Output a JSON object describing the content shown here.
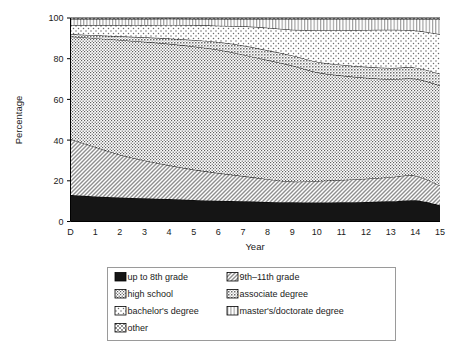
{
  "chart_data": {
    "type": "area",
    "title": "",
    "xlabel": "Year",
    "ylabel": "Percentage",
    "xlim": [
      0,
      16
    ],
    "ylim": [
      0,
      100
    ],
    "grid": false,
    "legend_position": "bottom",
    "categories": [
      "D",
      "1",
      "2",
      "3",
      "4",
      "5",
      "6",
      "7",
      "8",
      "9",
      "10",
      "11",
      "12",
      "13",
      "14",
      "15"
    ],
    "x_tick_labels": [
      "D",
      "1",
      "2",
      "3",
      "4",
      "5",
      "6",
      "7",
      "8",
      "9",
      "10",
      "11",
      "12",
      "13",
      "14",
      "15"
    ],
    "y_tick_labels": [
      "0",
      "20",
      "40",
      "60",
      "80",
      "100"
    ],
    "y_ticks": [
      0,
      20,
      40,
      60,
      80,
      100
    ],
    "stacked": true,
    "series": [
      {
        "name": "up to 8th grade",
        "pattern": "solid-black",
        "values": [
          13.0,
          12.3,
          11.8,
          11.4,
          11.0,
          10.6,
          10.2,
          9.9,
          9.6,
          9.4,
          9.3,
          9.4,
          9.6,
          9.9,
          10.4,
          8.0
        ]
      },
      {
        "name": "9th-11th grade",
        "pattern": "diagonal-hatch-light",
        "values": [
          27.5,
          24.3,
          21.0,
          18.6,
          16.6,
          14.9,
          13.6,
          12.4,
          11.2,
          10.2,
          10.6,
          11.0,
          11.4,
          11.9,
          12.1,
          9.6
        ]
      },
      {
        "name": "high school",
        "pattern": "fine-dots",
        "values": [
          50.4,
          53.5,
          56.4,
          58.3,
          59.7,
          60.5,
          60.6,
          59.7,
          58.5,
          57.0,
          53.4,
          51.3,
          49.6,
          48.1,
          47.6,
          49.2
        ]
      },
      {
        "name": "associate degree",
        "pattern": "dense-cross-dots",
        "values": [
          1.1,
          1.4,
          1.8,
          2.2,
          2.6,
          3.2,
          3.8,
          4.5,
          4.8,
          5.0,
          5.2,
          5.3,
          5.4,
          5.5,
          5.5,
          5.8
        ]
      },
      {
        "name": "bachelor's degree",
        "pattern": "sparse-dots",
        "values": [
          4.5,
          5.0,
          5.5,
          6.0,
          6.7,
          7.3,
          8.0,
          9.4,
          11.1,
          12.6,
          15.5,
          17.0,
          18.1,
          18.8,
          18.2,
          19.4
        ]
      },
      {
        "name": "master's/doctorate degree",
        "pattern": "vertical-lines",
        "values": [
          3.0,
          3.0,
          3.0,
          3.0,
          3.0,
          3.0,
          3.3,
          3.6,
          4.3,
          5.3,
          5.5,
          5.5,
          5.4,
          5.3,
          5.7,
          7.4
        ]
      },
      {
        "name": "other",
        "pattern": "cross-hatch",
        "values": [
          0.5,
          0.5,
          0.5,
          0.5,
          0.4,
          0.5,
          0.5,
          0.5,
          0.5,
          0.5,
          0.5,
          0.5,
          0.5,
          0.5,
          0.5,
          0.6
        ]
      }
    ]
  },
  "axes": {
    "y_label": "Percentage",
    "x_label": "Year",
    "y_tick_0": "0",
    "y_tick_1": "20",
    "y_tick_2": "40",
    "y_tick_3": "60",
    "y_tick_4": "80",
    "y_tick_5": "100",
    "x_tick_0": "D",
    "x_tick_1": "1",
    "x_tick_2": "2",
    "x_tick_3": "3",
    "x_tick_4": "4",
    "x_tick_5": "5",
    "x_tick_6": "6",
    "x_tick_7": "7",
    "x_tick_8": "8",
    "x_tick_9": "9",
    "x_tick_10": "10",
    "x_tick_11": "11",
    "x_tick_12": "12",
    "x_tick_13": "13",
    "x_tick_14": "14",
    "x_tick_15": "15"
  },
  "legend": {
    "items": [
      {
        "label": "up to 8th grade",
        "pattern": "solid-black"
      },
      {
        "label": "9th–11th grade",
        "pattern": "diagonal-hatch-light"
      },
      {
        "label": "high school",
        "pattern": "fine-dots"
      },
      {
        "label": "associate degree",
        "pattern": "dense-cross-dots"
      },
      {
        "label": "bachelor's degree",
        "pattern": "sparse-dots"
      },
      {
        "label": "master's/doctorate degree",
        "pattern": "vertical-lines"
      },
      {
        "label": "other",
        "pattern": "cross-hatch"
      }
    ],
    "item_0": "up to 8th grade",
    "item_1": "9th–11th grade",
    "item_2": "high school",
    "item_3": "associate degree",
    "item_4": "bachelor's degree",
    "item_5": "master's/doctorate degree",
    "item_6": "other"
  },
  "colors": {
    "background": "#ffffff",
    "foreground": "#000000",
    "legend_border": "#9a9a9a"
  }
}
